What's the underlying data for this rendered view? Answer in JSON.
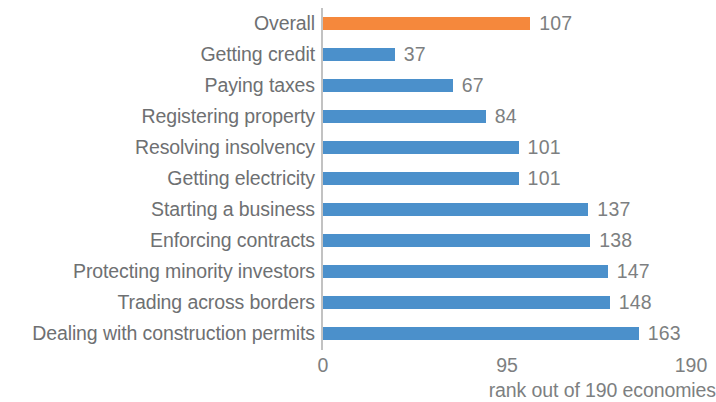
{
  "chart_data": {
    "type": "bar",
    "orientation": "horizontal",
    "title": "",
    "subtitle": "",
    "xlabel": "rank out of 190 economies",
    "ylabel": "",
    "xlim": [
      0,
      190
    ],
    "x_ticks": [
      "0",
      "95",
      "190"
    ],
    "x_tick_values": [
      0,
      95,
      190
    ],
    "grid": false,
    "legend": "none",
    "categories": [
      "Overall",
      "Getting credit",
      "Paying taxes",
      "Registering property",
      "Resolving insolvency",
      "Getting electricity",
      "Starting a business",
      "Enforcing contracts",
      "Protecting minority investors",
      "Trading across borders",
      "Dealing with construction permits"
    ],
    "values": [
      107,
      37,
      67,
      84,
      101,
      101,
      137,
      138,
      147,
      148,
      163
    ],
    "value_labels": [
      "107",
      "37",
      "67",
      "84",
      "101",
      "101",
      "137",
      "138",
      "147",
      "148",
      "163"
    ],
    "bar_colors": [
      "#f5883c",
      "#4b90cb",
      "#4b90cb",
      "#4b90cb",
      "#4b90cb",
      "#4b90cb",
      "#4b90cb",
      "#4b90cb",
      "#4b90cb",
      "#4b90cb",
      "#4b90cb"
    ],
    "colors": {
      "highlight": "#f5883c",
      "series": "#4b90cb",
      "text": "#6e7072",
      "axis": "#c2c2c2",
      "background": "#ffffff"
    }
  }
}
